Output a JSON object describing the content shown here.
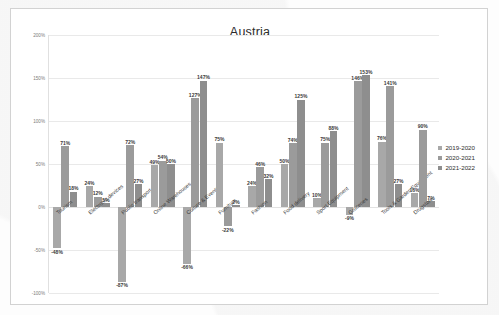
{
  "chart": {
    "title": "Austria"
  },
  "legend": {
    "position": "right",
    "entries": [
      {
        "label": "2019-2020",
        "color": "#a8a8a8"
      },
      {
        "label": "2020-2021",
        "color": "#9b9b9b"
      },
      {
        "label": "2021-2022",
        "color": "#8e8e8e"
      }
    ]
  },
  "yaxis": {
    "ticks": [
      "200%",
      "150%",
      "100%",
      "50%",
      "0%",
      "-50%",
      "-100%"
    ]
  },
  "chart_data": {
    "type": "bar",
    "title": "Austria",
    "xlabel": "",
    "ylabel": "",
    "ylim": [
      -100,
      200
    ],
    "grid": true,
    "legend_position": "right",
    "value_suffix": "%",
    "categories": [
      "Tourism",
      "Electronic devices",
      "Public transport",
      "Online Warehouses",
      "Culture & Events",
      "Furniture",
      "Fashion",
      "Food delivery",
      "Sport Equipment",
      "Groceries",
      "Tools & Garden Equipment",
      "Drugstore"
    ],
    "series": [
      {
        "name": "2019-2020",
        "color": "#a8a8a8",
        "values": [
          -48,
          24,
          -87,
          49,
          -66,
          75,
          24,
          50,
          10,
          -9,
          76,
          16
        ]
      },
      {
        "name": "2020-2021",
        "color": "#9b9b9b",
        "values": [
          71,
          12,
          72,
          54,
          127,
          -22,
          46,
          74,
          75,
          146,
          141,
          90
        ]
      },
      {
        "name": "2021-2022",
        "color": "#8e8e8e",
        "values": [
          18,
          5,
          27,
          50,
          147,
          2,
          32,
          125,
          88,
          153,
          27,
          7
        ]
      }
    ],
    "data_labels": [
      {
        "category": "Tourism",
        "series": "2019-2020",
        "text": "-48%"
      },
      {
        "category": "Tourism",
        "series": "2020-2021",
        "text": "71%"
      },
      {
        "category": "Tourism",
        "series": "2021-2022",
        "text": "18%"
      },
      {
        "category": "Electronic devices",
        "series": "2019-2020",
        "text": "24%"
      },
      {
        "category": "Electronic devices",
        "series": "2020-2021",
        "text": "12%"
      },
      {
        "category": "Electronic devices",
        "series": "2021-2022",
        "text": "5%"
      },
      {
        "category": "Public transport",
        "series": "2019-2020",
        "text": "-87%"
      },
      {
        "category": "Public transport",
        "series": "2020-2021",
        "text": "72%"
      },
      {
        "category": "Public transport",
        "series": "2021-2022",
        "text": "27%"
      },
      {
        "category": "Online Warehouses",
        "series": "2019-2020",
        "text": "49%"
      },
      {
        "category": "Online Warehouses",
        "series": "2020-2021",
        "text": "54%"
      },
      {
        "category": "Online Warehouses",
        "series": "2021-2022",
        "text": "50%"
      },
      {
        "category": "Culture & Events",
        "series": "2019-2020",
        "text": "-66%"
      },
      {
        "category": "Culture & Events",
        "series": "2020-2021",
        "text": "127%"
      },
      {
        "category": "Culture & Events",
        "series": "2021-2022",
        "text": "147%"
      },
      {
        "category": "Furniture",
        "series": "2019-2020",
        "text": "75%"
      },
      {
        "category": "Furniture",
        "series": "2020-2021",
        "text": "-22%"
      },
      {
        "category": "Furniture",
        "series": "2021-2022",
        "text": "2%"
      },
      {
        "category": "Fashion",
        "series": "2019-2020",
        "text": "24%"
      },
      {
        "category": "Fashion",
        "series": "2020-2021",
        "text": "46%"
      },
      {
        "category": "Fashion",
        "series": "2021-2022",
        "text": "32%"
      },
      {
        "category": "Food delivery",
        "series": "2019-2020",
        "text": "50%"
      },
      {
        "category": "Food delivery",
        "series": "2020-2021",
        "text": "74%"
      },
      {
        "category": "Food delivery",
        "series": "2021-2022",
        "text": "125%"
      },
      {
        "category": "Sport Equipment",
        "series": "2019-2020",
        "text": "10%"
      },
      {
        "category": "Sport Equipment",
        "series": "2020-2021",
        "text": "75%"
      },
      {
        "category": "Sport Equipment",
        "series": "2021-2022",
        "text": "88%"
      },
      {
        "category": "Groceries",
        "series": "2019-2020",
        "text": "-9%"
      },
      {
        "category": "Groceries",
        "series": "2020-2021",
        "text": "146%"
      },
      {
        "category": "Groceries",
        "series": "2021-2022",
        "text": "153%"
      },
      {
        "category": "Tools & Garden Equipment",
        "series": "2019-2020",
        "text": "76%"
      },
      {
        "category": "Tools & Garden Equipment",
        "series": "2020-2021",
        "text": "141%"
      },
      {
        "category": "Tools & Garden Equipment",
        "series": "2021-2022",
        "text": "27%"
      },
      {
        "category": "Drugstore",
        "series": "2019-2020",
        "text": "16%"
      },
      {
        "category": "Drugstore",
        "series": "2020-2021",
        "text": "90%"
      },
      {
        "category": "Drugstore",
        "series": "2021-2022",
        "text": "7%"
      }
    ]
  }
}
